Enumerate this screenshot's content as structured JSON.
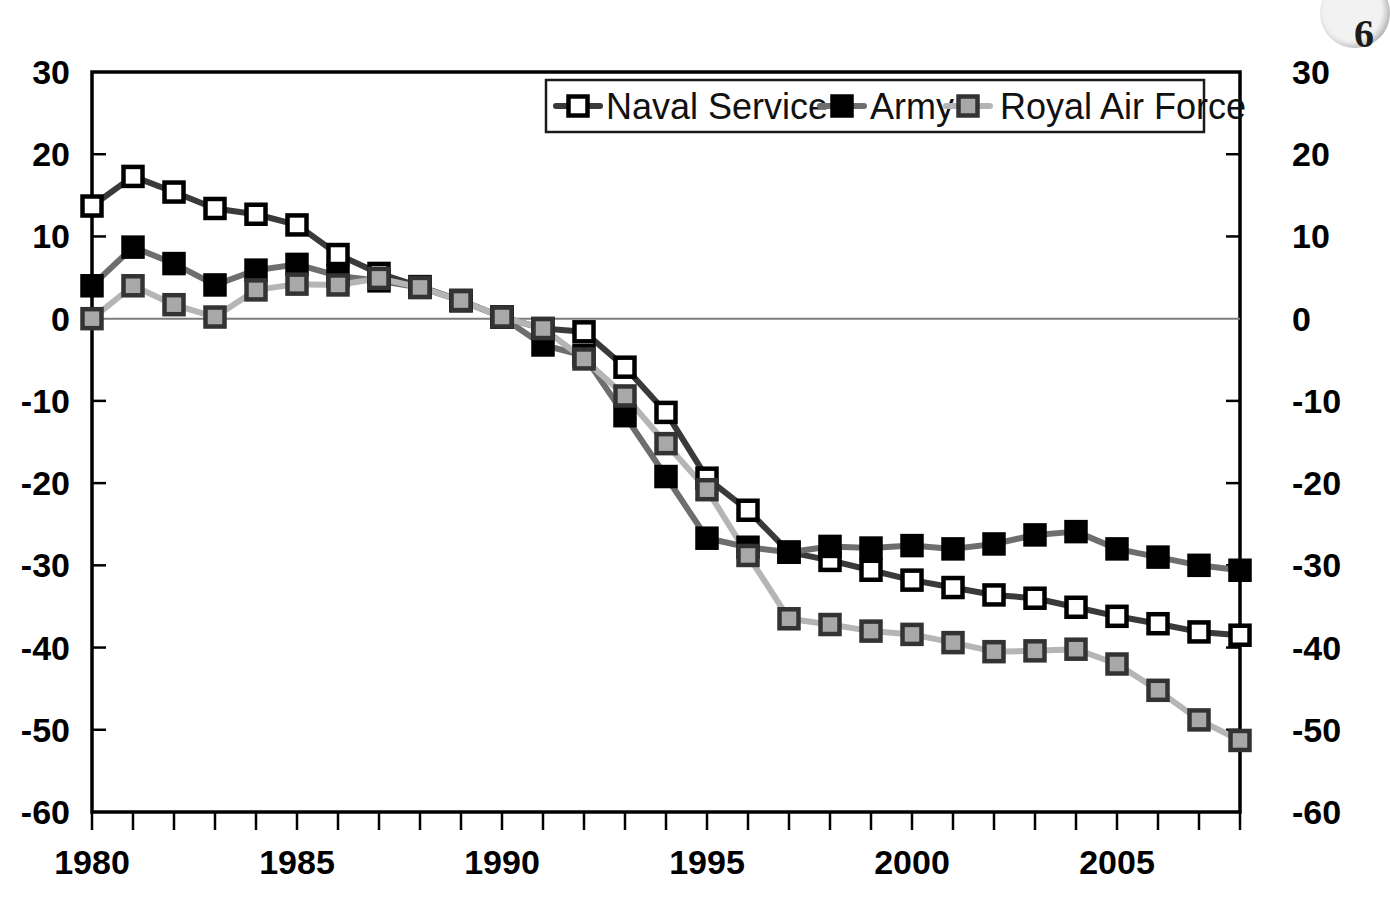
{
  "chart_data": {
    "type": "line",
    "title": "",
    "subtitle": "",
    "xlabel": "",
    "ylabel": "",
    "xlim": [
      1980,
      2008
    ],
    "ylim": [
      -60,
      30
    ],
    "grid": false,
    "legend_position": "top-center",
    "y_ticks": [
      30,
      20,
      10,
      0,
      -10,
      -20,
      -30,
      -40,
      -50,
      -60
    ],
    "y_tick_labels_left": [
      "30",
      "20",
      "10",
      "0",
      "-10",
      "-20",
      "-30",
      "-40",
      "-50",
      "-60"
    ],
    "y_tick_labels_right": [
      "30",
      "20",
      "10",
      "0",
      "-10",
      "-20",
      "-30",
      "-40",
      "-50",
      "-60"
    ],
    "x_ticks": [
      1980,
      1985,
      1990,
      1995,
      2000,
      2005
    ],
    "x_tick_labels": [
      "1980",
      "1985",
      "1990",
      "1995",
      "2000",
      "2005"
    ],
    "x_minor_ticks_every": 1,
    "zero_line": 0,
    "x": [
      1980,
      1981,
      1982,
      1983,
      1984,
      1985,
      1986,
      1987,
      1988,
      1989,
      1990,
      1991,
      1992,
      1993,
      1994,
      1995,
      1996,
      1997,
      1998,
      1999,
      2000,
      2001,
      2002,
      2003,
      2004,
      2005,
      2006,
      2007,
      2008
    ],
    "series": [
      {
        "name": "Naval Service",
        "marker": "open-square",
        "marker_fill": "#ffffff",
        "marker_stroke": "#000000",
        "line_color": "#3a3a3a",
        "values": [
          13.7,
          17.3,
          15.4,
          13.4,
          12.7,
          11.4,
          7.8,
          5.5,
          3.9,
          2.2,
          0.2,
          -1.2,
          -1.6,
          -5.9,
          -11.4,
          -19.4,
          -23.3,
          -28.4,
          -29.4,
          -30.6,
          -31.8,
          -32.7,
          -33.6,
          -34.0,
          -35.1,
          -36.2,
          -37.1,
          -38.1,
          -38.5
        ]
      },
      {
        "name": "Army",
        "marker": "filled-square",
        "marker_fill": "#000000",
        "marker_stroke": "#000000",
        "line_color": "#6e6e6e",
        "values": [
          4.0,
          8.7,
          6.7,
          4.1,
          5.9,
          6.6,
          5.2,
          4.6,
          3.8,
          2.2,
          0.2,
          -3.2,
          -4.5,
          -11.8,
          -19.2,
          -26.7,
          -27.8,
          -28.4,
          -27.7,
          -27.9,
          -27.6,
          -28.0,
          -27.4,
          -26.3,
          -25.9,
          -28.0,
          -29.0,
          -30.0,
          -30.6
        ]
      },
      {
        "name": "Royal Air Force",
        "marker": "filled-square",
        "marker_fill": "#a8a8a8",
        "marker_stroke": "#333333",
        "line_color": "#b5b5b5",
        "values": [
          0.0,
          4.0,
          1.7,
          0.2,
          3.5,
          4.2,
          4.1,
          4.9,
          3.8,
          2.2,
          0.2,
          -1.2,
          -4.9,
          -9.4,
          -15.2,
          -20.8,
          -28.8,
          -36.5,
          -37.2,
          -38.0,
          -38.4,
          -39.4,
          -40.5,
          -40.4,
          -40.2,
          -42.0,
          -45.2,
          -48.8,
          -51.3
        ]
      }
    ],
    "legend": [
      {
        "label": "Naval Service",
        "marker": "open-square"
      },
      {
        "label": "Army",
        "marker": "filled-square-black"
      },
      {
        "label": "Royal Air Force",
        "marker": "filled-square-gray"
      }
    ]
  },
  "artifact": {
    "corner_glyph": "6"
  }
}
